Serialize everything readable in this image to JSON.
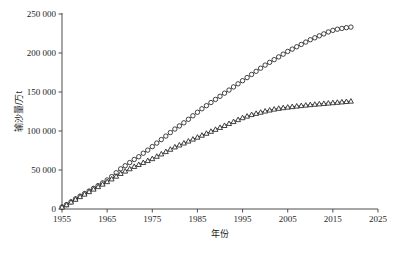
{
  "chart_data": {
    "type": "line",
    "title": "",
    "xlabel": "年份",
    "ylabel": "输沙量/万t",
    "xlim": [
      1955,
      2025
    ],
    "ylim": [
      0,
      250000
    ],
    "xticks": [
      1955,
      1965,
      1975,
      1985,
      1995,
      2005,
      2015,
      2025
    ],
    "xtick_labels": [
      "1955",
      "1965",
      "1975",
      "1985",
      "1995",
      "2005",
      "2015",
      "2025"
    ],
    "yticks": [
      0,
      50000,
      100000,
      150000,
      200000,
      250000
    ],
    "ytick_labels": [
      "0",
      "50 000",
      "100 000",
      "150 000",
      "200 000",
      "250 000"
    ],
    "grid": false,
    "legend": "none",
    "x": [
      1955,
      1956,
      1957,
      1958,
      1959,
      1960,
      1961,
      1962,
      1963,
      1964,
      1965,
      1966,
      1967,
      1968,
      1969,
      1970,
      1971,
      1972,
      1973,
      1974,
      1975,
      1976,
      1977,
      1978,
      1979,
      1980,
      1981,
      1982,
      1983,
      1984,
      1985,
      1986,
      1987,
      1988,
      1989,
      1990,
      1991,
      1992,
      1993,
      1994,
      1995,
      1996,
      1997,
      1998,
      1999,
      2000,
      2001,
      2002,
      2003,
      2004,
      2005,
      2006,
      2007,
      2008,
      2009,
      2010,
      2011,
      2012,
      2013,
      2014,
      2015,
      2016,
      2017,
      2018,
      2019
    ],
    "series": [
      {
        "name": "累计输沙量(圆点)",
        "marker": "circle",
        "values": [
          2500,
          5600,
          9200,
          13000,
          16500,
          19800,
          23000,
          26500,
          30000,
          33500,
          37200,
          41500,
          46500,
          51500,
          55500,
          59500,
          63500,
          67000,
          71500,
          75500,
          80000,
          84500,
          89000,
          93500,
          98000,
          102500,
          106500,
          110500,
          115000,
          119500,
          124000,
          128500,
          132500,
          136500,
          140500,
          144500,
          148500,
          152500,
          156500,
          160500,
          164500,
          168500,
          172500,
          176500,
          180500,
          184500,
          188000,
          191500,
          195000,
          198500,
          202000,
          205000,
          208000,
          211000,
          214000,
          217000,
          219500,
          222000,
          224500,
          227000,
          229000,
          230500,
          231500,
          232500,
          233200
        ]
      },
      {
        "name": "累计输沙量(三角)",
        "marker": "triangle",
        "values": [
          2400,
          5300,
          8800,
          12400,
          15800,
          19000,
          22200,
          25400,
          28600,
          31800,
          35000,
          38500,
          42000,
          45500,
          48500,
          51500,
          54500,
          57000,
          59500,
          62000,
          64500,
          67500,
          70500,
          73500,
          76500,
          79500,
          82000,
          84500,
          87000,
          89500,
          92000,
          94500,
          97000,
          99500,
          102000,
          104500,
          107000,
          109500,
          112000,
          114500,
          117000,
          119000,
          121000,
          122500,
          124000,
          125500,
          126800,
          128000,
          129000,
          129800,
          130500,
          131200,
          131900,
          132500,
          133100,
          133700,
          134200,
          134700,
          135200,
          135700,
          136200,
          136700,
          137200,
          137700,
          138200
        ]
      }
    ]
  },
  "axis": {
    "y_title": "输沙量/万t",
    "x_title": "年份"
  }
}
